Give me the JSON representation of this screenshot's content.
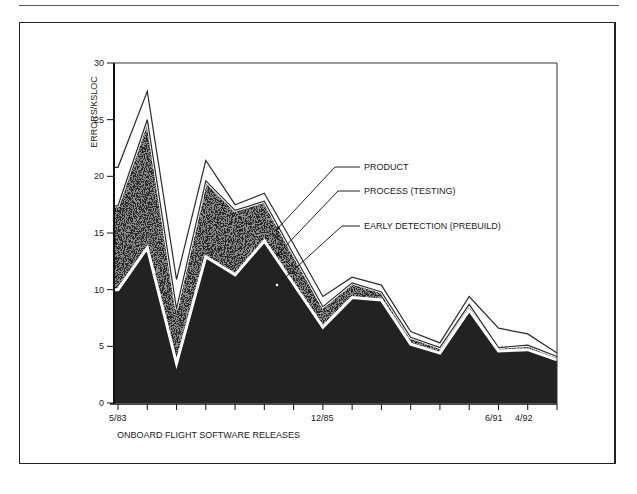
{
  "chart_data": {
    "type": "area",
    "title": "",
    "xlabel": "ONBOARD FLIGHT SOFTWARE RELEASES",
    "ylabel": "ERRORS/KSLOC",
    "ylim": [
      0,
      30
    ],
    "yticks": [
      0,
      5,
      10,
      15,
      20,
      25,
      30
    ],
    "grid": false,
    "legend_position": "callouts, right-center",
    "x": [
      1,
      2,
      3,
      4,
      5,
      6,
      7,
      8,
      9,
      10,
      11,
      12,
      13,
      14,
      15,
      16
    ],
    "x_tick_labels": {
      "0": "5/83",
      "7": "12/85",
      "13": "6/91",
      "14": "4/92"
    },
    "series": [
      {
        "name": "PRODUCT",
        "values": [
          20.8,
          27.5,
          10.9,
          21.4,
          17.5,
          18.5,
          14.0,
          9.4,
          11.1,
          10.4,
          6.3,
          5.3,
          9.4,
          6.6,
          6.1,
          4.4
        ]
      },
      {
        "name": "PROCESS (TESTING)",
        "values": [
          17.4,
          25.0,
          8.3,
          19.6,
          17.0,
          17.8,
          13.1,
          8.5,
          10.6,
          9.8,
          5.8,
          4.9,
          8.7,
          4.9,
          5.1,
          4.1
        ]
      },
      {
        "name": "EARLY DETECTION (PREBUILD)",
        "values": [
          10.0,
          13.7,
          3.5,
          12.9,
          11.3,
          14.3,
          10.5,
          6.7,
          9.3,
          9.1,
          5.2,
          4.4,
          8.2,
          4.6,
          4.7,
          3.8
        ]
      }
    ]
  },
  "axis": {
    "y_title": "ERRORS/KSLOC",
    "x_title": "ONBOARD FLIGHT SOFTWARE RELEASES",
    "y_ticks": [
      "0",
      "5",
      "10",
      "15",
      "20",
      "25",
      "30"
    ],
    "x_labels": [
      "5/83",
      "12/85",
      "6/91",
      "4/92"
    ]
  },
  "legend": {
    "product": "PRODUCT",
    "process": "PROCESS (TESTING)",
    "early": "EARLY DETECTION (PREBUILD)"
  },
  "colors": {
    "line": "#2b2b2b",
    "dense_fill": "#1e1e1e",
    "medium_fill": "#5a5a5a",
    "light_fill": "#b8b8b8"
  }
}
